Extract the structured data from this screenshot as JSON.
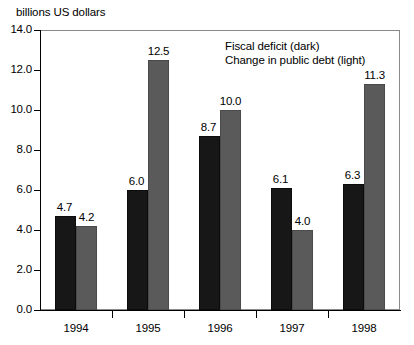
{
  "chart_data": {
    "type": "bar",
    "title": "billions US dollars",
    "xlabel": "",
    "ylabel": "billions US dollars",
    "ylim": [
      0.0,
      14.0
    ],
    "ytick_labels": [
      "0.0",
      "2.0",
      "4.0",
      "6.0",
      "8.0",
      "10.0",
      "12.0",
      "14.0"
    ],
    "ytick_values": [
      0.0,
      2.0,
      4.0,
      6.0,
      8.0,
      10.0,
      12.0,
      14.0
    ],
    "grid": false,
    "legend_position": "inside-top-right",
    "categories": [
      "1994",
      "1995",
      "1996",
      "1997",
      "1998"
    ],
    "series": [
      {
        "name": "Fiscal deficit (dark)",
        "color": "#171717",
        "values": [
          4.7,
          6.0,
          8.7,
          6.1,
          6.3
        ],
        "labels": [
          "4.7",
          "6.0",
          "8.7",
          "6.1",
          "6.3"
        ]
      },
      {
        "name": "Change in public debt (light)",
        "color": "#5a5a5a",
        "values": [
          4.2,
          12.5,
          10.0,
          4.0,
          11.3
        ],
        "labels": [
          "4.2",
          "12.5",
          "10.0",
          "4.0",
          "11.3"
        ]
      }
    ],
    "legend": [
      "Fiscal deficit (dark)",
      "Change in public debt (light)"
    ]
  }
}
